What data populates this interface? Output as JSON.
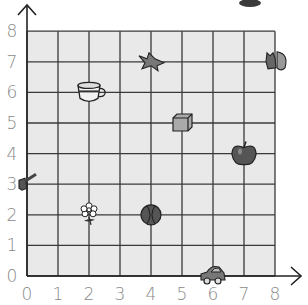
{
  "diagram": {
    "type": "coordinate-grid",
    "grid_fill": "#e9e9e9",
    "line_color": "#3a3a3a",
    "x_axis": {
      "min": 0,
      "max": 8,
      "ticks": [
        "0",
        "1",
        "2",
        "3",
        "4",
        "5",
        "6",
        "7",
        "8"
      ]
    },
    "y_axis": {
      "min": 0,
      "max": 8,
      "ticks": [
        "0",
        "1",
        "2",
        "3",
        "4",
        "5",
        "6",
        "7",
        "8"
      ]
    },
    "points": [
      {
        "name": "cup",
        "icon": "cup-icon",
        "x": 2,
        "y": 6
      },
      {
        "name": "bird",
        "icon": "bird-icon",
        "x": 4,
        "y": 7
      },
      {
        "name": "squirrel",
        "icon": "squirrel-icon",
        "x": 8,
        "y": 7
      },
      {
        "name": "box",
        "icon": "box-icon",
        "x": 5,
        "y": 5
      },
      {
        "name": "apple",
        "icon": "apple-icon",
        "x": 7,
        "y": 4
      },
      {
        "name": "key",
        "icon": "key-icon",
        "x": 0,
        "y": 3
      },
      {
        "name": "flower",
        "icon": "flower-icon",
        "x": 2,
        "y": 2
      },
      {
        "name": "ball",
        "icon": "ball-icon",
        "x": 4,
        "y": 2
      },
      {
        "name": "car",
        "icon": "car-icon",
        "x": 6,
        "y": 0
      }
    ]
  }
}
